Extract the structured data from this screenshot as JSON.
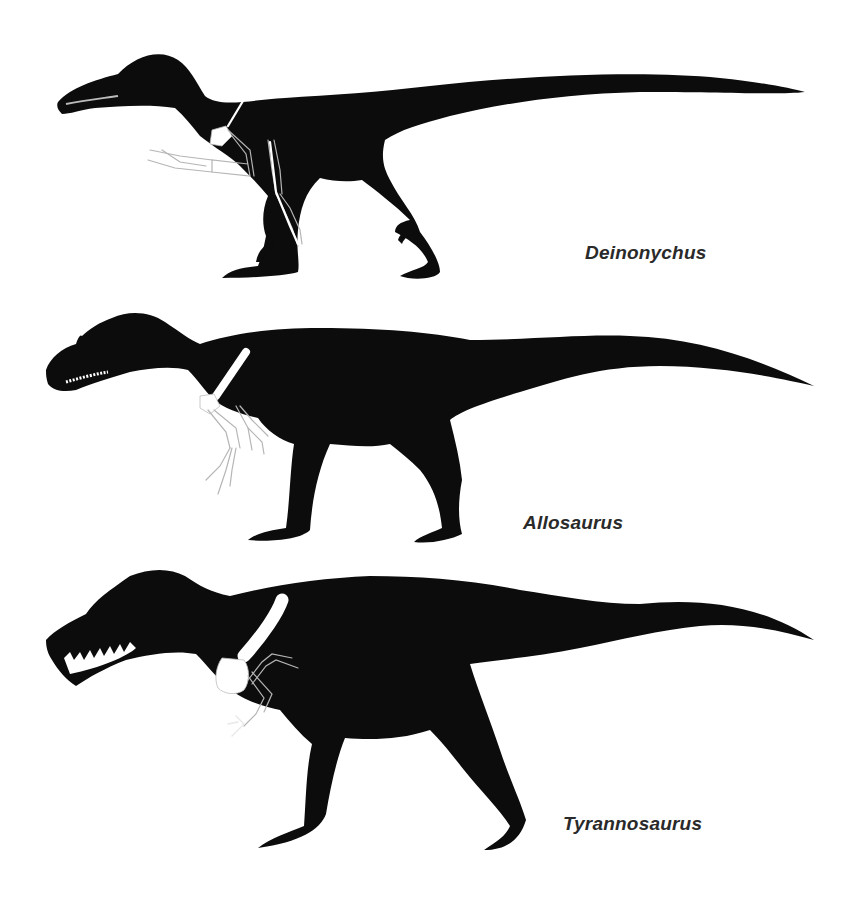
{
  "figure": {
    "background": "#ffffff",
    "silhouette_color": "#0c0c0c",
    "bone_color": "#ffffff",
    "label_color": "#2a2a2a"
  },
  "specimens": [
    {
      "name": "Deinonychus",
      "position": "top"
    },
    {
      "name": "Allosaurus",
      "position": "middle"
    },
    {
      "name": "Tyrannosaurus",
      "position": "bottom"
    }
  ]
}
